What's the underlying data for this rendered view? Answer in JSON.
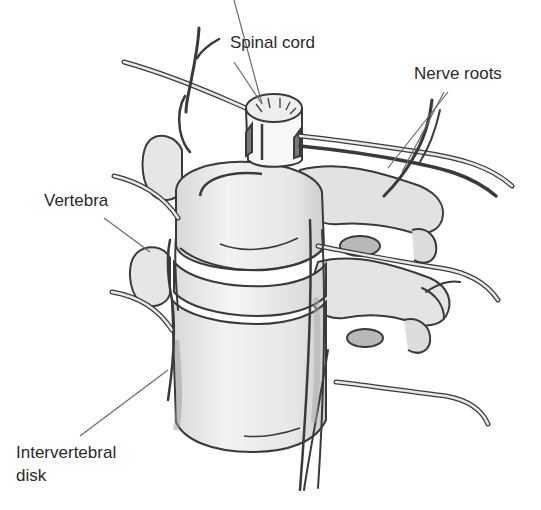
{
  "figure": {
    "background": "#ffffff",
    "ink_color": "#2a2a2a",
    "labels": {
      "spinal_cord": "Spinal cord",
      "nerve_roots": "Nerve roots",
      "vertebra": "Vertebra",
      "intervertebral_disk": "Intervertebral\ndisk"
    },
    "colors": {
      "bone_fill": "#ededed",
      "bone_shade": "#cfcfcf",
      "outline": "#3a3a3a",
      "leader_line": "#6a6a6a",
      "disk_fill": "#f4f4f4",
      "cord_fill": "#f7f7f7",
      "root_fill": "#bdbdbd"
    }
  }
}
